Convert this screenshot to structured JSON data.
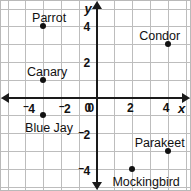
{
  "chart_data": {
    "type": "scatter",
    "title": "",
    "xlabel": "x",
    "ylabel": "y",
    "xlim": [
      -5,
      5
    ],
    "ylim": [
      -5,
      5
    ],
    "grid": true,
    "legend": "none",
    "x_ticks": [
      {
        "value": -4,
        "label": "4",
        "negative": true
      },
      {
        "value": -2,
        "label": "2",
        "negative": true
      },
      {
        "value": 0,
        "label": "0",
        "negative": false
      },
      {
        "value": 2,
        "label": "2",
        "negative": false
      },
      {
        "value": 4,
        "label": "4",
        "negative": false
      }
    ],
    "y_ticks": [
      {
        "value": 4,
        "label": "4",
        "negative": false
      },
      {
        "value": 2,
        "label": "2",
        "negative": false
      },
      {
        "value": 0,
        "label": "0",
        "negative": false
      },
      {
        "value": -2,
        "label": "2",
        "negative": true
      },
      {
        "value": -4,
        "label": "4",
        "negative": true
      }
    ],
    "points": [
      {
        "name": "Parrot",
        "x": -3,
        "y": 4,
        "label": "Parrot",
        "label_dx": 6,
        "label_dy": -14
      },
      {
        "name": "Condor",
        "x": 4,
        "y": 3,
        "label": "Condor",
        "label_dx": -8,
        "label_dy": -14
      },
      {
        "name": "Canary",
        "x": -3,
        "y": 1,
        "label": "Canary",
        "label_dx": 4,
        "label_dy": -14
      },
      {
        "name": "Blue Jay",
        "x": -3,
        "y": -1,
        "label": "Blue Jay",
        "label_dx": 6,
        "label_dy": 7
      },
      {
        "name": "Parakeet",
        "x": 4,
        "y": -3,
        "label": "Parakeet",
        "label_dx": -8,
        "label_dy": -14
      },
      {
        "name": "Mockingbird",
        "x": 2,
        "y": -4,
        "label": "Mockingbird",
        "label_dx": 14,
        "label_dy": 7
      }
    ],
    "colors": {
      "point": "#111111",
      "axis": "#1a1a1a",
      "grid": "#bdbdbd",
      "background": "#ffffff",
      "text": "#111111"
    }
  }
}
